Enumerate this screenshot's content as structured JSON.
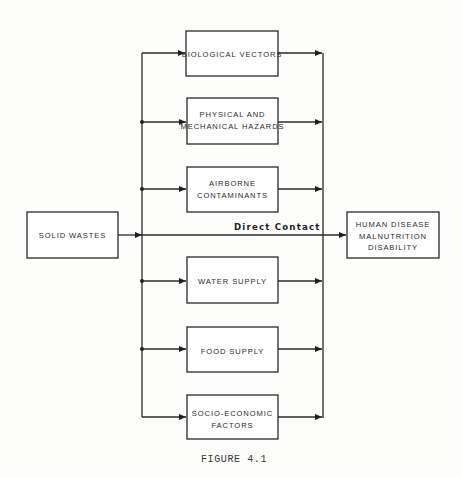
{
  "figure": {
    "caption": "FIGURE 4.1"
  },
  "source": {
    "lines": [
      "SOLID WASTES"
    ]
  },
  "pathways": [
    {
      "lines": [
        "BIOLOGICAL VECTORS"
      ]
    },
    {
      "lines": [
        "PHYSICAL AND",
        "MECHANICAL HAZARDS"
      ]
    },
    {
      "lines": [
        "AIRBORNE",
        "CONTAMINANTS"
      ]
    },
    {
      "lines": [
        "WATER SUPPLY"
      ]
    },
    {
      "lines": [
        "FOOD SUPPLY"
      ]
    },
    {
      "lines": [
        "SOCIO-ECONOMIC",
        "FACTORS"
      ]
    }
  ],
  "direct_path": {
    "label": "Direct Contact"
  },
  "outcome": {
    "lines": [
      "HUMAN DISEASE",
      "MALNUTRITION",
      "DISABILITY"
    ]
  }
}
